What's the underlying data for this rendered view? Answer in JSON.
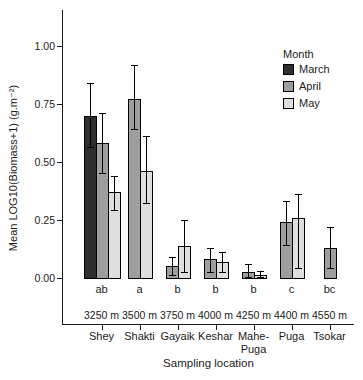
{
  "chart_data": {
    "type": "bar",
    "title": "",
    "ylabel": "Mean LOG10(Biomass+1) (g.m⁻²)",
    "xlabel": "Sampling location",
    "ylim": [
      0,
      1.0
    ],
    "grid": false,
    "yticks": [
      {
        "value": 0.0,
        "label": "0.00"
      },
      {
        "value": 0.25,
        "label": "0.25"
      },
      {
        "value": 0.5,
        "label": "0.50"
      },
      {
        "value": 0.75,
        "label": "0.75"
      },
      {
        "value": 1.0,
        "label": "1.00"
      }
    ],
    "legend": {
      "title": "Month",
      "position": "top-right-inside",
      "entries": [
        {
          "label": "March",
          "color": "#2e2e2e"
        },
        {
          "label": "April",
          "color": "#9e9e9e"
        },
        {
          "label": "May",
          "color": "#dedede"
        }
      ]
    },
    "groups": [
      {
        "location": "Shey",
        "altitude": "3250 m",
        "sig": "ab",
        "bars": [
          {
            "month": "March",
            "value": 0.7,
            "err_lo": 0.56,
            "err_hi": 0.84
          },
          {
            "month": "April",
            "value": 0.58,
            "err_lo": 0.45,
            "err_hi": 0.71
          },
          {
            "month": "May",
            "value": 0.37,
            "err_lo": 0.29,
            "err_hi": 0.44
          }
        ]
      },
      {
        "location": "Shakti",
        "altitude": "3500 m",
        "sig": "a",
        "bars": [
          {
            "month": "April",
            "value": 0.77,
            "err_lo": 0.64,
            "err_hi": 0.92
          },
          {
            "month": "May",
            "value": 0.46,
            "err_lo": 0.32,
            "err_hi": 0.61
          }
        ]
      },
      {
        "location": "Gayaik",
        "altitude": "3750 m",
        "sig": "b",
        "bars": [
          {
            "month": "April",
            "value": 0.05,
            "err_lo": 0.01,
            "err_hi": 0.09
          },
          {
            "month": "May",
            "value": 0.14,
            "err_lo": 0.02,
            "err_hi": 0.25
          }
        ]
      },
      {
        "location": "Keshar",
        "altitude": "4000 m",
        "sig": "b",
        "bars": [
          {
            "month": "April",
            "value": 0.08,
            "err_lo": 0.02,
            "err_hi": 0.13
          },
          {
            "month": "May",
            "value": 0.07,
            "err_lo": 0.02,
            "err_hi": 0.11
          }
        ]
      },
      {
        "location": "Mahe-\nPuga",
        "altitude": "4250 m",
        "sig": "b",
        "bars": [
          {
            "month": "April",
            "value": 0.025,
            "err_lo": 0.0,
            "err_hi": 0.06
          },
          {
            "month": "May",
            "value": 0.012,
            "err_lo": 0.0,
            "err_hi": 0.03
          }
        ]
      },
      {
        "location": "Puga",
        "altitude": "4400 m",
        "sig": "c",
        "bars": [
          {
            "month": "April",
            "value": 0.24,
            "err_lo": 0.14,
            "err_hi": 0.33
          },
          {
            "month": "May",
            "value": 0.26,
            "err_lo": 0.04,
            "err_hi": 0.36
          }
        ]
      },
      {
        "location": "Tsokar",
        "altitude": "4550 m",
        "sig": "bc",
        "bars": [
          {
            "month": "April",
            "value": 0.13,
            "err_lo": 0.04,
            "err_hi": 0.22
          }
        ]
      }
    ]
  }
}
